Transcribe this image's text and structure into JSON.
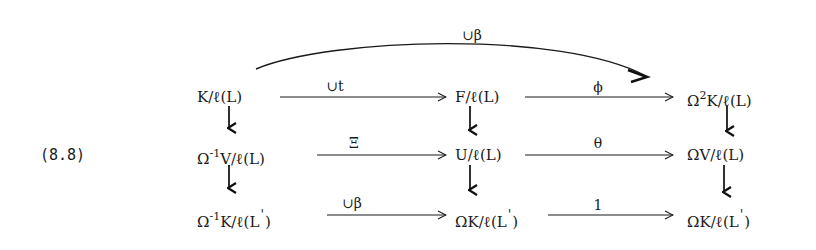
{
  "equation_label": "(8.8)",
  "nodes": {
    "r1c1": {
      "pre": "",
      "sup": "",
      "main": "K/ℓ(L)",
      "prime": ""
    },
    "r1c2": {
      "pre": "",
      "sup": "",
      "main": "F/ℓ(L)",
      "prime": ""
    },
    "r1c3": {
      "pre": "Ω",
      "sup": "2",
      "main": "K/ℓ(L)",
      "prime": ""
    },
    "r2c1": {
      "pre": "Ω",
      "sup": "-1",
      "main": "V/ℓ(L)",
      "prime": ""
    },
    "r2c2": {
      "pre": "",
      "sup": "",
      "main": "U/ℓ(L)",
      "prime": ""
    },
    "r2c3": {
      "pre": "",
      "sup": "",
      "main": "ΩV/ℓ(L)",
      "prime": ""
    },
    "r3c1": {
      "pre": "Ω",
      "sup": "-1",
      "main": "K/ℓ(L",
      "prime": "'",
      "close": ")"
    },
    "r3c2": {
      "pre": "",
      "sup": "",
      "main": "ΩK/ℓ(L",
      "prime": "'",
      "close": ")"
    },
    "r3c3": {
      "pre": "",
      "sup": "",
      "main": "ΩK/ℓ(L",
      "prime": "'",
      "close": ")"
    }
  },
  "edges": {
    "curved_top": "∪β",
    "r1_c1_c2": "∪t",
    "r1_c2_c3": "ϕ",
    "r2_c1_c2": "Ξ",
    "r2_c2_c3": "θ",
    "r3_c1_c2": "∪β",
    "r3_c2_c3": "1"
  }
}
